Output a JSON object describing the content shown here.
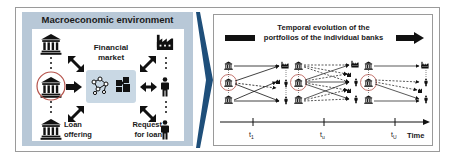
{
  "left_panel": {
    "title": "Macroeconomic environment",
    "center_label_line1": "Financial",
    "center_label_line2": "market",
    "bottom_left_label_line1": "Loan",
    "bottom_left_label_line2": "offering",
    "bottom_right_label_line1": "Request",
    "bottom_right_label_line2": "for loan",
    "icons": [
      "bank-icon",
      "bank-icon-highlighted",
      "bank-icon",
      "factory-icon",
      "person-icon",
      "person-icon",
      "network-icon",
      "puzzle-icon"
    ],
    "colors": {
      "panel_bg": "#b8c8d7",
      "highlight_circle": "#b5524a",
      "market_box": "#c9d8e4"
    }
  },
  "transition": {
    "chevron_color": "#1f4f7a"
  },
  "right_panel": {
    "title_line1": "Temporal evolution of the",
    "title_line2": "portfolios of the individual banks",
    "timeline": {
      "ticks": [
        "t1",
        "tu",
        "tU"
      ],
      "tick_labels": [
        {
          "base": "t",
          "sub": "1"
        },
        {
          "base": "t",
          "sub": "u"
        },
        {
          "base": "t",
          "sub": "U"
        }
      ],
      "axis_label": "Time"
    },
    "snapshots": [
      {
        "time": "t1",
        "banks": 3,
        "borrowers": [
          "factory",
          "firm",
          "person",
          "person"
        ]
      },
      {
        "time": "tu",
        "banks": 3,
        "borrowers": [
          "factory",
          "firm",
          "person",
          "firm",
          "person"
        ]
      },
      {
        "time": "tU",
        "banks": 3,
        "borrowers": [
          "factory",
          "person",
          "firm",
          "person"
        ]
      }
    ]
  }
}
